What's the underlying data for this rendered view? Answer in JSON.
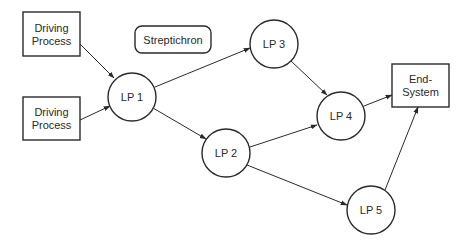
{
  "diagram": {
    "type": "directed-graph",
    "nodes": [
      {
        "id": "dp1",
        "shape": "rect",
        "lines": [
          "Driving",
          "Process"
        ],
        "x": 23,
        "y": 12,
        "w": 57,
        "h": 44
      },
      {
        "id": "dp2",
        "shape": "rect",
        "lines": [
          "Driving",
          "Process"
        ],
        "x": 23,
        "y": 97,
        "w": 57,
        "h": 43
      },
      {
        "id": "strep",
        "shape": "rounded-rect",
        "lines": [
          "Streptichron"
        ],
        "x": 135,
        "y": 26,
        "w": 76,
        "h": 27
      },
      {
        "id": "lp1",
        "shape": "circle",
        "lines": [
          "LP 1"
        ],
        "cx": 132,
        "cy": 97,
        "r": 24
      },
      {
        "id": "lp2",
        "shape": "circle",
        "lines": [
          "LP 2"
        ],
        "cx": 226,
        "cy": 153,
        "r": 24
      },
      {
        "id": "lp3",
        "shape": "circle",
        "lines": [
          "LP 3"
        ],
        "cx": 274,
        "cy": 44,
        "r": 24
      },
      {
        "id": "lp4",
        "shape": "circle",
        "lines": [
          "LP 4"
        ],
        "cx": 341,
        "cy": 116,
        "r": 24
      },
      {
        "id": "lp5",
        "shape": "circle",
        "lines": [
          "LP 5"
        ],
        "cx": 371,
        "cy": 210,
        "r": 24
      },
      {
        "id": "end",
        "shape": "rect",
        "lines": [
          "End-",
          "System"
        ],
        "x": 392,
        "y": 64,
        "w": 57,
        "h": 43
      }
    ],
    "edges": [
      {
        "from": "dp1",
        "to": "lp1",
        "x1": 80,
        "y1": 44,
        "x2": 114,
        "y2": 78
      },
      {
        "from": "dp2",
        "to": "lp1",
        "x1": 80,
        "y1": 120,
        "x2": 110,
        "y2": 106
      },
      {
        "from": "lp1",
        "to": "lp3",
        "x1": 155,
        "y1": 87,
        "x2": 250,
        "y2": 48
      },
      {
        "from": "lp1",
        "to": "lp2",
        "x1": 153,
        "y1": 108,
        "x2": 206,
        "y2": 139
      },
      {
        "from": "lp3",
        "to": "lp4",
        "x1": 291,
        "y1": 61,
        "x2": 327,
        "y2": 95
      },
      {
        "from": "lp2",
        "to": "lp4",
        "x1": 250,
        "y1": 147,
        "x2": 317,
        "y2": 125
      },
      {
        "from": "lp4",
        "to": "end",
        "x1": 364,
        "y1": 106,
        "x2": 392,
        "y2": 95
      },
      {
        "from": "lp2",
        "to": "lp5",
        "x1": 247,
        "y1": 165,
        "x2": 347,
        "y2": 205
      },
      {
        "from": "lp5",
        "to": "end",
        "x1": 385,
        "y1": 190,
        "x2": 418,
        "y2": 107
      }
    ],
    "colors": {
      "stroke": "#2a2a2a",
      "fill": "#ffffff",
      "text": "#2a2a2a",
      "background": "#ffffff"
    }
  }
}
